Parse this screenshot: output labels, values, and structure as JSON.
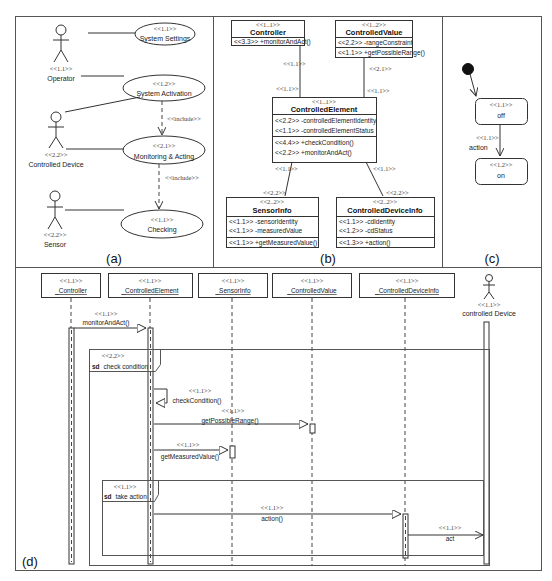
{
  "panels": {
    "a": "(a)",
    "b": "(b)",
    "c": "(c)",
    "d": "(d)"
  },
  "use_case": {
    "actors": [
      {
        "stereotype": "<<1.1>>",
        "name": "Operator"
      },
      {
        "stereotype": "<<2.2>>",
        "name": "Controlled Device"
      },
      {
        "stereotype": "<<2.2>>",
        "name": "Sensor"
      }
    ],
    "use_cases": [
      {
        "stereotype": "<<1.1>>",
        "name": "System Settings"
      },
      {
        "stereotype": "<<1.2>>",
        "name": "System Activation"
      },
      {
        "stereotype": "<<2.1>>",
        "name": "Monitoring & Acting"
      },
      {
        "stereotype": "<<1.1>>",
        "name": "Checking"
      }
    ],
    "relations": [
      {
        "label": "<<include>>"
      },
      {
        "label": "<<include>>"
      }
    ]
  },
  "class_diagram": {
    "classes": [
      {
        "stereotype": "<<1..1>>",
        "name": "Controller",
        "attributes": [],
        "operations": [
          "<<3.3>> +monitorAndAct()"
        ]
      },
      {
        "stereotype": "<<1..2>>",
        "name": "ControlledValue",
        "attributes": [
          "<<2.2>> -rangeConstraint"
        ],
        "operations": [
          "<<1.1>> +getPossibleRange()"
        ]
      },
      {
        "stereotype": "<<1..1>>",
        "name": "ControlledElement",
        "attributes": [
          "<<2.2>> -controlledElementIdentity",
          "<<1.1>> -controlledElementStatus"
        ],
        "operations": [
          "<<4.4>> +checkCondition()",
          "<<2.2>> +monitorAndAct()"
        ]
      },
      {
        "stereotype": "<<2..2>>",
        "name": "SensorInfo",
        "attributes": [
          "<<1.1>> -sensorIdentity",
          "<<1.1>> -measuredValue"
        ],
        "operations": [
          "<<1.1>> +getMeasuredValue()"
        ]
      },
      {
        "stereotype": "<<2..2>>",
        "name": "ControlledDeviceInfo",
        "attributes": [
          "<<1.1>> -cdIdentity",
          "<<1.2>> -cdStatus"
        ],
        "operations": [
          "<<1.3>> +action()"
        ]
      }
    ],
    "associations": [
      {
        "end1": "<<1.1>>",
        "end2": "<<1.1>>"
      },
      {
        "end1": "<<2.1>>",
        "end2": "<<1.1>>"
      },
      {
        "end1": "<<1.1>>",
        "end2": "<<2.2>>"
      },
      {
        "end1": "<<1.1>>",
        "end2": "<<2.2>>"
      }
    ]
  },
  "state_diagram": {
    "states": [
      {
        "stereotype": "<<1.1>>",
        "name": "off"
      },
      {
        "stereotype": "<<1.2>>",
        "name": "on"
      }
    ],
    "transition": {
      "stereotype": "<<1.1>>",
      "label": "action"
    }
  },
  "sequence": {
    "lifelines": [
      {
        "stereotype": "<<1.1>>",
        "name": "_Controller"
      },
      {
        "stereotype": "<<1.1>>",
        "name": "_ControlledElement"
      },
      {
        "stereotype": "<<1.1>>",
        "name": "_SensorInfo"
      },
      {
        "stereotype": "<<1.1>>",
        "name": "_ControlledValue"
      },
      {
        "stereotype": "<<1.1>>",
        "name": "_ControlledDeviceInfo"
      }
    ],
    "actor": {
      "stereotype": "<<1.1>>",
      "name": "controlled Device"
    },
    "messages": [
      {
        "stereotype": "<<1.1>>",
        "label": "monitorAndAct()"
      },
      {
        "stereotype": "<<1.1>>",
        "label": "checkCondition()"
      },
      {
        "stereotype": "<<1.1>>",
        "label": "getPossibleRange()"
      },
      {
        "stereotype": "<<1.1>>",
        "label": "getMeasuredValue()"
      },
      {
        "stereotype": "<<1.1>>",
        "label": "action()"
      },
      {
        "stereotype": "<<1.1>>",
        "label": "act"
      }
    ],
    "fragments": [
      {
        "stereotype": "<<2.2>>",
        "keyword": "sd",
        "name": "check condition"
      },
      {
        "stereotype": "<<1.1>>",
        "keyword": "sd",
        "name": "take action"
      }
    ]
  }
}
